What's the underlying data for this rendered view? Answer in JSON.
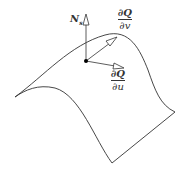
{
  "diagram": {
    "type": "surface-tangent-normal",
    "labels": {
      "normal": {
        "main": "N",
        "sub": "s"
      },
      "tangent_v": {
        "numerator": "∂Q",
        "denominator": "∂v"
      },
      "tangent_u": {
        "numerator": "∂Q",
        "denominator": "∂u"
      }
    },
    "colors": {
      "stroke": "#333333",
      "arrow_fill": "#ffffff",
      "point": "#000000"
    }
  }
}
